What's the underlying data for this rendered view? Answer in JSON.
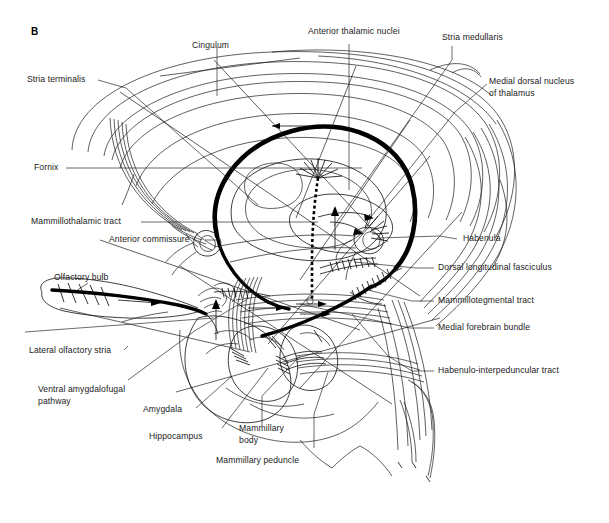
{
  "figure": {
    "panel_letter": "B",
    "kind": "neuroanatomical line diagram of the limbic system"
  },
  "labels": {
    "cingulum": "Cingulum",
    "anterior_thalamic_nuclei": "Anterior thalamic nuclei",
    "stria_medullaris": "Stria medullaris",
    "medial_dorsal_nucleus_line1": "Medial dorsal nucleus",
    "medial_dorsal_nucleus_line2": "of thalamus",
    "stria_terminalis": "Stria terminalis",
    "fornix": "Fornix",
    "mammillothalamic_tract": "Mammillothalamic tract",
    "anterior_commissure": "Anterior commissure",
    "habenula": "Habenula",
    "dorsal_longitudinal_fasciculus": "Dorsal longitudinal fasciculus",
    "mammillotegmental_tract": "Mammillotegmental tract",
    "medial_forebrain_bundle": "Medial forebrain bundle",
    "habenulo_interpeduncular_tract": "Habenulo-interpeduncular tract",
    "olfactory_bulb": "Olfactory bulb",
    "lateral_olfactory_stria": "Lateral olfactory stria",
    "ventral_amygdalofugal_line1": "Ventral amygdalofugal",
    "ventral_amygdalofugal_line2": "pathway",
    "amygdala": "Amygdala",
    "hippocampus": "Hippocampus",
    "mammillary_body_line1": "Mammillary",
    "mammillary_body_line2": "body",
    "mammillary_peduncle": "Mammillary peduncle"
  },
  "colors": {
    "ink": "#1a1a1a",
    "background": "#ffffff",
    "emphasis_stroke": "#000000"
  }
}
